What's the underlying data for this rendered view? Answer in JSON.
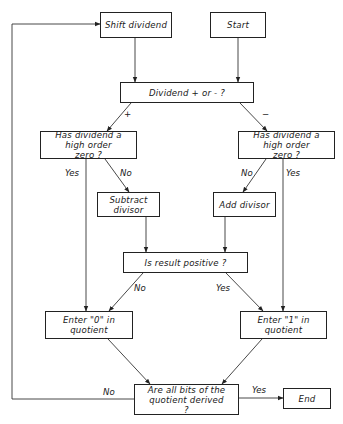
{
  "diagram": {
    "type": "flowchart",
    "nodes": {
      "shift_dividend": "Shift dividend",
      "start": "Start",
      "dividend_sign": "Dividend + or - ?",
      "left_high_order_zero": "Has dividend a high order zero ?",
      "right_high_order_zero": "Has dividend a high order zero ?",
      "subtract_divisor": "Subtract divisor",
      "add_divisor": "Add divisor",
      "result_positive": "Is result positive ?",
      "enter_zero": "Enter \"0\" in quotient",
      "enter_one": "Enter \"1\" in quotient",
      "all_bits_derived": "Are all bits of the quotient derived ?",
      "end": "End"
    },
    "edge_labels": {
      "plus": "+",
      "minus": "−",
      "left_yes": "Yes",
      "left_no": "No",
      "right_no": "No",
      "right_yes": "Yes",
      "result_no": "No",
      "result_yes": "Yes",
      "loop_no": "No",
      "done_yes": "Yes"
    },
    "edges": [
      {
        "from": "start",
        "to": "dividend_sign"
      },
      {
        "from": "shift_dividend",
        "to": "dividend_sign"
      },
      {
        "from": "dividend_sign",
        "to": "left_high_order_zero",
        "label": "+"
      },
      {
        "from": "dividend_sign",
        "to": "right_high_order_zero",
        "label": "−"
      },
      {
        "from": "left_high_order_zero",
        "to": "enter_zero",
        "label": "Yes"
      },
      {
        "from": "left_high_order_zero",
        "to": "subtract_divisor",
        "label": "No"
      },
      {
        "from": "right_high_order_zero",
        "to": "add_divisor",
        "label": "No"
      },
      {
        "from": "right_high_order_zero",
        "to": "enter_one",
        "label": "Yes"
      },
      {
        "from": "subtract_divisor",
        "to": "result_positive"
      },
      {
        "from": "add_divisor",
        "to": "result_positive"
      },
      {
        "from": "result_positive",
        "to": "enter_zero",
        "label": "No"
      },
      {
        "from": "result_positive",
        "to": "enter_one",
        "label": "Yes"
      },
      {
        "from": "enter_zero",
        "to": "all_bits_derived"
      },
      {
        "from": "enter_one",
        "to": "all_bits_derived"
      },
      {
        "from": "all_bits_derived",
        "to": "shift_dividend",
        "label": "No"
      },
      {
        "from": "all_bits_derived",
        "to": "end",
        "label": "Yes"
      }
    ]
  }
}
